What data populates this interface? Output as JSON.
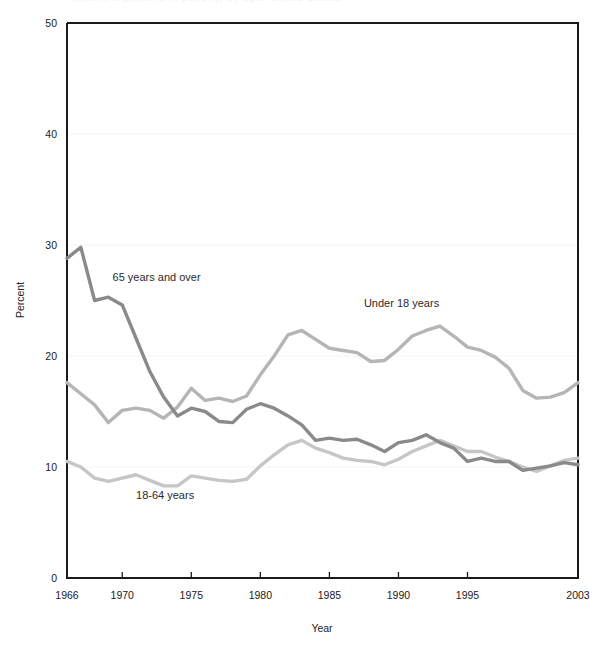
{
  "figure": {
    "title_sliver": "Percent of persons in poverty, by age: United States",
    "background": "#ffffff"
  },
  "chart_data": {
    "type": "line",
    "title": "",
    "xlabel": "Year",
    "ylabel": "Percent",
    "xlim": [
      1966,
      2003
    ],
    "ylim": [
      0,
      50
    ],
    "yticks": [
      0,
      10,
      20,
      30,
      40,
      50
    ],
    "ytick_labels": [
      "0",
      "10",
      "20",
      "30",
      "40",
      "50"
    ],
    "xticks": [
      1966,
      1970,
      1975,
      1980,
      1985,
      1990,
      1995,
      2003
    ],
    "xtick_labels": [
      "1966",
      "1970",
      "1975",
      "1980",
      "1985",
      "1990",
      "1995",
      "2003"
    ],
    "grid": true,
    "grid_axis": "y",
    "legend_position": "inline-annotations",
    "x": [
      1966,
      1967,
      1968,
      1969,
      1970,
      1971,
      1972,
      1973,
      1974,
      1975,
      1976,
      1977,
      1978,
      1979,
      1980,
      1981,
      1982,
      1983,
      1984,
      1985,
      1986,
      1987,
      1988,
      1989,
      1990,
      1991,
      1992,
      1993,
      1994,
      1995,
      1996,
      1997,
      1998,
      1999,
      2000,
      2001,
      2002,
      2003
    ],
    "series": [
      {
        "name": "65 years and over",
        "color": "#8a8a8a",
        "label_x": 1969.3,
        "label_y": 26.8,
        "values": [
          28.8,
          29.8,
          25.0,
          25.3,
          24.6,
          21.6,
          18.6,
          16.3,
          14.6,
          15.3,
          15.0,
          14.1,
          14.0,
          15.2,
          15.7,
          15.3,
          14.6,
          13.8,
          12.4,
          12.6,
          12.4,
          12.5,
          12.0,
          11.4,
          12.2,
          12.4,
          12.9,
          12.2,
          11.7,
          10.5,
          10.8,
          10.5,
          10.5,
          9.7,
          9.9,
          10.1,
          10.4,
          10.2
        ]
      },
      {
        "name": "Under 18 years",
        "color": "#b5b5b5",
        "label_x": 1987.5,
        "label_y": 24.4,
        "values": [
          17.6,
          16.6,
          15.6,
          14.0,
          15.1,
          15.3,
          15.1,
          14.4,
          15.4,
          17.1,
          16.0,
          16.2,
          15.9,
          16.4,
          18.3,
          20.0,
          21.9,
          22.3,
          21.5,
          20.7,
          20.5,
          20.3,
          19.5,
          19.6,
          20.6,
          21.8,
          22.3,
          22.7,
          21.8,
          20.8,
          20.5,
          19.9,
          18.9,
          16.9,
          16.2,
          16.3,
          16.7,
          17.6
        ]
      },
      {
        "name": "18-64 years",
        "color": "#c6c6c6",
        "label_x": 1971.0,
        "label_y": 7.1,
        "values": [
          10.5,
          10.0,
          9.0,
          8.7,
          9.0,
          9.3,
          8.8,
          8.3,
          8.3,
          9.2,
          9.0,
          8.8,
          8.7,
          8.9,
          10.1,
          11.1,
          12.0,
          12.4,
          11.7,
          11.3,
          10.8,
          10.6,
          10.5,
          10.2,
          10.7,
          11.4,
          11.9,
          12.4,
          11.9,
          11.4,
          11.4,
          10.9,
          10.5,
          10.0,
          9.6,
          10.1,
          10.6,
          10.8
        ]
      }
    ]
  }
}
